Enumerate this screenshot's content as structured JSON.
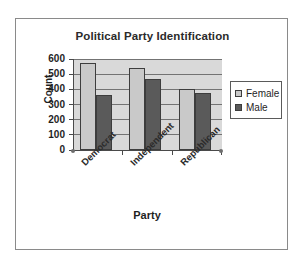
{
  "chart_data": {
    "type": "bar",
    "title": "Political Party Identification",
    "xlabel": "Party",
    "ylabel": "Count",
    "categories": [
      "Democrat",
      "Independent",
      "Republican"
    ],
    "series": [
      {
        "name": "Female",
        "color": "#c9c9c9",
        "values": [
          575,
          540,
          400
        ]
      },
      {
        "name": "Male",
        "color": "#5a5a5a",
        "values": [
          360,
          465,
          378
        ]
      }
    ],
    "ylim": [
      0,
      600
    ],
    "yticks": [
      0,
      100,
      200,
      300,
      400,
      500,
      600
    ],
    "ytick_labels": [
      "0",
      "100",
      "200",
      "300",
      "400",
      "500",
      "600"
    ],
    "grid": true,
    "grid_axis": "y",
    "legend_position": "right",
    "legend_entries": [
      "Female",
      "Male"
    ],
    "plot_background": "#d9d9d9",
    "figure_background": "#ffffff",
    "category_label_rotation": -45
  }
}
